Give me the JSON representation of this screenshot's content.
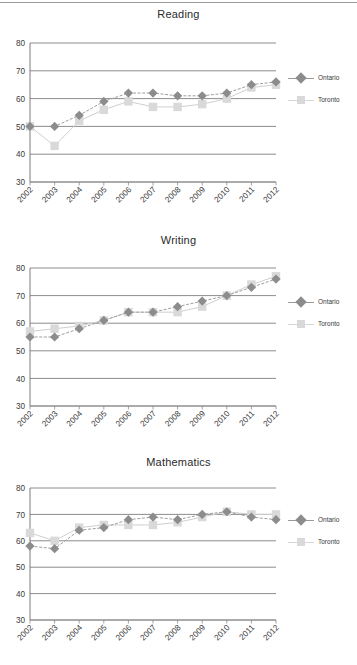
{
  "page": {
    "width": 357,
    "height": 665,
    "background": "#ffffff",
    "top_rule_color": "#9a9a9a"
  },
  "series_style": {
    "ontario": {
      "name": "Ontario",
      "color": "#8c8c8c",
      "line_color": "#9a9a9a",
      "marker": "diamond"
    },
    "toronto": {
      "name": "Toronto",
      "color": "#d3d3d3",
      "line_color": "#c9c9c9",
      "marker": "square"
    }
  },
  "legend": {
    "ontario_label": "Ontario",
    "toronto_label": "Toronto"
  },
  "axis": {
    "y_ticks": [
      "30",
      "40",
      "50",
      "60",
      "70",
      "80"
    ],
    "x_ticks": [
      "2002",
      "2003",
      "2004",
      "2005",
      "2006",
      "2007",
      "2008",
      "2009",
      "2010",
      "2011",
      "2012"
    ]
  },
  "titles": {
    "reading": "Reading",
    "writing": "Writing",
    "mathematics": "Mathematics"
  },
  "chart_data": [
    {
      "type": "line",
      "title": "Reading",
      "xlabel": "",
      "ylabel": "",
      "x": [
        2002,
        2003,
        2004,
        2005,
        2006,
        2007,
        2008,
        2009,
        2010,
        2011,
        2012
      ],
      "categories": [
        "2002",
        "2003",
        "2004",
        "2005",
        "2006",
        "2007",
        "2008",
        "2009",
        "2010",
        "2011",
        "2012"
      ],
      "ylim": [
        30,
        80
      ],
      "yticks": [
        30,
        40,
        50,
        60,
        70,
        80
      ],
      "grid": true,
      "legend_position": "right",
      "series": [
        {
          "name": "Ontario",
          "values": [
            50,
            50,
            54,
            59,
            62,
            62,
            61,
            61,
            62,
            65,
            66
          ]
        },
        {
          "name": "Toronto",
          "values": [
            50,
            43,
            52,
            56,
            59,
            57,
            57,
            58,
            60,
            64,
            65
          ]
        }
      ]
    },
    {
      "type": "line",
      "title": "Writing",
      "xlabel": "",
      "ylabel": "",
      "x": [
        2002,
        2003,
        2004,
        2005,
        2006,
        2007,
        2008,
        2009,
        2010,
        2011,
        2012
      ],
      "categories": [
        "2002",
        "2003",
        "2004",
        "2005",
        "2006",
        "2007",
        "2008",
        "2009",
        "2010",
        "2011",
        "2012"
      ],
      "ylim": [
        30,
        80
      ],
      "yticks": [
        30,
        40,
        50,
        60,
        70,
        80
      ],
      "grid": true,
      "legend_position": "right",
      "series": [
        {
          "name": "Ontario",
          "values": [
            55,
            55,
            58,
            61,
            64,
            64,
            66,
            68,
            70,
            73,
            76
          ]
        },
        {
          "name": "Toronto",
          "values": [
            57,
            58,
            59,
            61,
            64,
            64,
            64,
            66,
            70,
            74,
            77
          ]
        }
      ]
    },
    {
      "type": "line",
      "title": "Mathematics",
      "xlabel": "",
      "ylabel": "",
      "x": [
        2002,
        2003,
        2004,
        2005,
        2006,
        2007,
        2008,
        2009,
        2010,
        2011,
        2012
      ],
      "categories": [
        "2002",
        "2003",
        "2004",
        "2005",
        "2006",
        "2007",
        "2008",
        "2009",
        "2010",
        "2011",
        "2012"
      ],
      "ylim": [
        30,
        80
      ],
      "yticks": [
        30,
        40,
        50,
        60,
        70,
        80
      ],
      "grid": true,
      "legend_position": "right",
      "series": [
        {
          "name": "Ontario",
          "values": [
            58,
            57,
            64,
            65,
            68,
            69,
            68,
            70,
            71,
            69,
            68
          ]
        },
        {
          "name": "Toronto",
          "values": [
            63,
            60,
            65,
            66,
            66,
            66,
            67,
            69,
            71,
            70,
            70
          ]
        }
      ]
    }
  ]
}
